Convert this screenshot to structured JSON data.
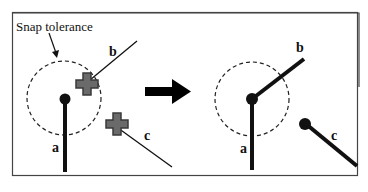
{
  "diagram": {
    "title_label": "Snap tolerance",
    "colors": {
      "frame": "#333333",
      "line": "#111111",
      "cross_fill": "#6a6a6a",
      "cross_stroke": "#3a3a3a",
      "arrow": "#000000",
      "background": "#ffffff"
    },
    "before": {
      "labels": {
        "a": "a",
        "b": "b",
        "c": "c"
      },
      "cursor_icons": [
        "move-cursor-b",
        "move-cursor-c"
      ]
    },
    "after": {
      "labels": {
        "a": "a",
        "b": "b",
        "c": "c"
      }
    },
    "transition": "arrow-right"
  }
}
